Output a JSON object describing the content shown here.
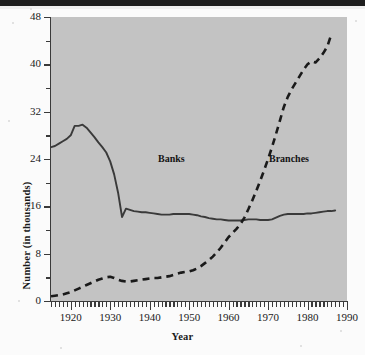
{
  "figure": {
    "background_color": "#c3c3c3",
    "page_color": "#fbfbfb",
    "line_color": "#3a3a3a"
  },
  "axes": {
    "x_title": "Year",
    "y_title": "Number (in thousands)",
    "x_ticks": [
      1920,
      1930,
      1940,
      1950,
      1960,
      1970,
      1980,
      1990
    ],
    "y_ticks": [
      0,
      8,
      16,
      24,
      32,
      40,
      48
    ],
    "y_minor_ticks": [
      4,
      12,
      20,
      28,
      36,
      44
    ],
    "x_min": 1915,
    "x_max": 1990,
    "y_min": 0,
    "y_max": 48
  },
  "annotations": [
    {
      "name": "banks-label",
      "text": "Banks"
    },
    {
      "name": "branches-label",
      "text": "Branches"
    }
  ],
  "chart_data": {
    "type": "line",
    "title": "",
    "xlabel": "Year",
    "ylabel": "Number (in thousands)",
    "xlim": [
      1915,
      1990
    ],
    "ylim": [
      0,
      48
    ],
    "grid": false,
    "legend": "inline-annotations",
    "series": [
      {
        "name": "Banks",
        "style": "solid",
        "color": "#3a3a3a",
        "x": [
          1915,
          1916,
          1917,
          1918,
          1919,
          1920,
          1921,
          1922,
          1923,
          1924,
          1925,
          1926,
          1927,
          1928,
          1929,
          1930,
          1931,
          1932,
          1933,
          1934,
          1935,
          1936,
          1937,
          1938,
          1939,
          1940,
          1941,
          1942,
          1943,
          1944,
          1945,
          1946,
          1947,
          1948,
          1949,
          1950,
          1951,
          1952,
          1953,
          1954,
          1955,
          1956,
          1957,
          1958,
          1959,
          1960,
          1961,
          1962,
          1963,
          1964,
          1965,
          1966,
          1967,
          1968,
          1969,
          1970,
          1971,
          1972,
          1973,
          1974,
          1975,
          1976,
          1977,
          1978,
          1979,
          1980,
          1981,
          1982,
          1983,
          1984,
          1985,
          1986,
          1987
        ],
        "y": [
          26.0,
          26.2,
          26.6,
          27.0,
          27.4,
          28.0,
          29.6,
          29.6,
          29.8,
          29.3,
          28.5,
          27.7,
          26.8,
          26.0,
          25.1,
          23.6,
          21.4,
          18.3,
          14.2,
          15.6,
          15.4,
          15.2,
          15.1,
          15.0,
          15.0,
          14.9,
          14.8,
          14.7,
          14.6,
          14.6,
          14.6,
          14.7,
          14.7,
          14.7,
          14.7,
          14.7,
          14.6,
          14.5,
          14.3,
          14.2,
          14.0,
          13.9,
          13.8,
          13.8,
          13.7,
          13.6,
          13.6,
          13.6,
          13.6,
          13.7,
          13.8,
          13.8,
          13.8,
          13.7,
          13.7,
          13.7,
          13.8,
          14.1,
          14.4,
          14.6,
          14.7,
          14.7,
          14.7,
          14.7,
          14.7,
          14.8,
          14.8,
          14.9,
          15.0,
          15.1,
          15.2,
          15.2,
          15.3
        ],
        "marker": "none",
        "note": "Number of U.S. banks, declines sharply after 1929 then stays near 14-15 thousand"
      },
      {
        "name": "Branches",
        "style": "dashed",
        "color": "#1a1a1a",
        "x": [
          1915,
          1916,
          1917,
          1918,
          1919,
          1920,
          1921,
          1922,
          1923,
          1924,
          1925,
          1926,
          1927,
          1928,
          1929,
          1930,
          1931,
          1932,
          1933,
          1934,
          1935,
          1936,
          1937,
          1938,
          1939,
          1940,
          1941,
          1942,
          1943,
          1944,
          1945,
          1946,
          1947,
          1948,
          1949,
          1950,
          1951,
          1952,
          1953,
          1954,
          1955,
          1956,
          1957,
          1958,
          1959,
          1960,
          1961,
          1962,
          1963,
          1964,
          1965,
          1966,
          1967,
          1968,
          1969,
          1970,
          1971,
          1972,
          1973,
          1974,
          1975,
          1976,
          1977,
          1978,
          1979,
          1980,
          1981,
          1982,
          1983,
          1984,
          1985,
          1986
        ],
        "y": [
          0.8,
          0.9,
          1.0,
          1.1,
          1.3,
          1.5,
          1.8,
          2.1,
          2.4,
          2.7,
          3.0,
          3.3,
          3.6,
          3.8,
          4.0,
          4.1,
          3.9,
          3.6,
          3.4,
          3.3,
          3.3,
          3.4,
          3.5,
          3.6,
          3.7,
          3.8,
          3.9,
          3.9,
          4.0,
          4.1,
          4.2,
          4.4,
          4.6,
          4.8,
          4.9,
          5.0,
          5.2,
          5.5,
          5.9,
          6.4,
          6.9,
          7.5,
          8.2,
          9.0,
          9.9,
          10.8,
          11.5,
          12.2,
          13.0,
          14.1,
          15.5,
          17.0,
          18.6,
          20.3,
          22.1,
          24.0,
          26.0,
          28.2,
          30.5,
          32.8,
          34.5,
          35.8,
          36.9,
          38.0,
          39.1,
          40.0,
          40.5,
          40.3,
          41.0,
          41.9,
          43.0,
          45.0
        ],
        "marker": "none",
        "note": "Number of U.S. bank branches, grows exponentially, crosses Banks near 1963"
      }
    ],
    "crossover": {
      "year": 1963,
      "value": 13.6
    }
  }
}
